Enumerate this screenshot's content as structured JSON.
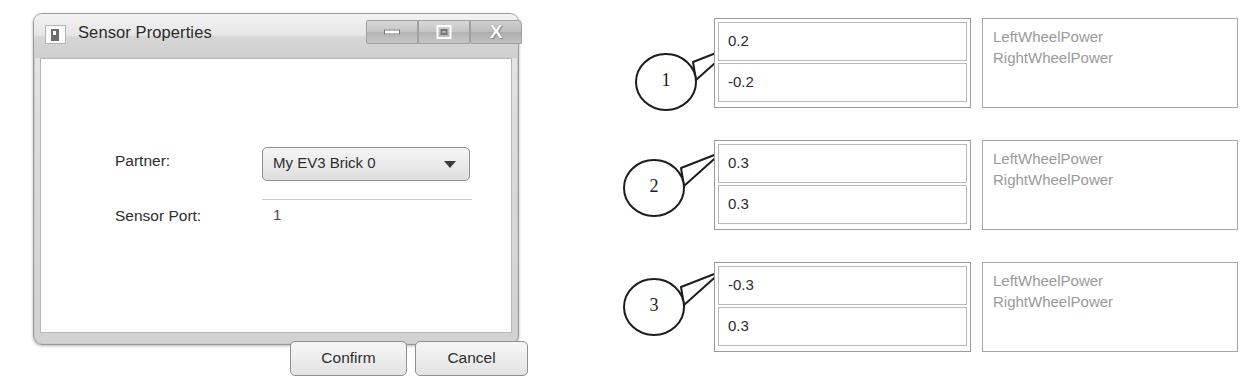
{
  "dialog": {
    "title": "Sensor Properties",
    "icon": "window-app-icon",
    "titlebar_buttons": [
      {
        "name": "minimize",
        "glyph": "minimize-icon"
      },
      {
        "name": "maximize",
        "glyph": "maximize-icon"
      },
      {
        "name": "close",
        "glyph": "close-icon",
        "label": "X"
      }
    ],
    "fields": [
      {
        "label": "Partner:",
        "value": "My EV3 Brick 0",
        "type": "dropdown"
      },
      {
        "label": "Sensor Port:",
        "value": "1",
        "type": "text"
      }
    ],
    "buttons": [
      {
        "label": "Confirm"
      },
      {
        "label": "Cancel"
      }
    ]
  },
  "rows": [
    {
      "callout": "1",
      "values": [
        "0.2",
        "-0.2"
      ],
      "labels": [
        "LeftWheelPower",
        "RightWheelPower"
      ]
    },
    {
      "callout": "2",
      "values": [
        "0.3",
        "0.3"
      ],
      "labels": [
        "LeftWheelPower",
        "RightWheelPower"
      ]
    },
    {
      "callout": "3",
      "values": [
        "-0.3",
        "0.3"
      ],
      "labels": [
        "LeftWheelPower",
        "RightWheelPower"
      ]
    }
  ],
  "colors": {
    "page_background": "#ffffff",
    "dialog_chrome": "#dcdcdc",
    "label_text": "#9a9a9a",
    "value_text": "#2c2c2c",
    "ink": "#1d1d1d"
  }
}
